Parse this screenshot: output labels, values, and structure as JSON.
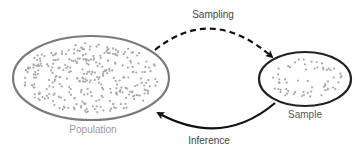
{
  "diagram": {
    "nodes": {
      "population": {
        "label": "Population",
        "label_color": "#9a9a9a",
        "border_color": "#7a7a7a"
      },
      "sample": {
        "label": "Sample",
        "label_color": "#555555",
        "border_color": "#222222"
      }
    },
    "edges": {
      "sampling": {
        "label": "Sampling",
        "style": "dashed",
        "from": "Population",
        "to": "Sample"
      },
      "inference": {
        "label": "Inference",
        "style": "solid",
        "from": "Sample",
        "to": "Population"
      }
    },
    "colors": {
      "dot": "#a8a8a8",
      "arrow": "#111111"
    }
  }
}
